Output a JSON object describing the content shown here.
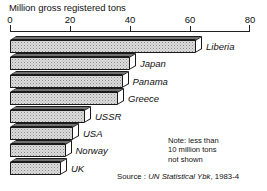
{
  "chart_data": {
    "type": "bar",
    "orientation": "horizontal",
    "title": "Million gross registered tons",
    "xlabel": "",
    "ylabel": "",
    "xlim": [
      0,
      80
    ],
    "grid": false,
    "legend": null,
    "tick_labels": [
      "0",
      "20",
      "40",
      "60",
      "80"
    ],
    "tick_values": [
      0,
      20,
      40,
      60,
      80
    ],
    "categories": [
      "Liberia",
      "Japan",
      "Panama",
      "Greece",
      "USSR",
      "USA",
      "Norway",
      "UK"
    ],
    "values": [
      62,
      40,
      37.5,
      36,
      25,
      21,
      18.5,
      17
    ],
    "bars": [
      {
        "label": "Liberia",
        "value": 62
      },
      {
        "label": "Japan",
        "value": 40
      },
      {
        "label": "Panama",
        "value": 37.5
      },
      {
        "label": "Greece",
        "value": 36
      },
      {
        "label": "USSR",
        "value": 25
      },
      {
        "label": "USA",
        "value": 21
      },
      {
        "label": "Norway",
        "value": 18.5
      },
      {
        "label": "UK",
        "value": 17
      }
    ],
    "annotations": {
      "note": [
        "Note: less than",
        "10 million tons",
        "not shown"
      ],
      "source_prefix": "Source : ",
      "source_publication": "UN Statistical Ybk",
      "source_year": ", 1983-4"
    },
    "colors": {
      "bar_face": "#dcdcdc",
      "bar_top": "#b9b9b9",
      "bar_side": "#ffffff",
      "outline": "#1a1a1a",
      "text": "#111111",
      "background": "#ffffff"
    }
  }
}
